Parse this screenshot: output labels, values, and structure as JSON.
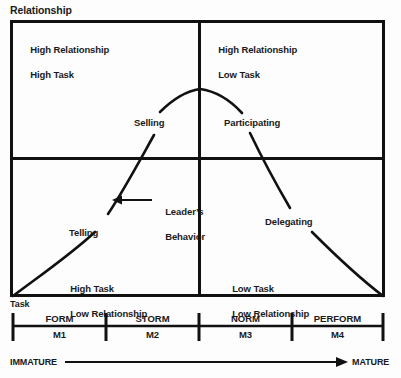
{
  "axes": {
    "y_label": "Relationship",
    "x_label": "Task"
  },
  "quadrants": [
    {
      "id": "q2",
      "line1": "High Relationship",
      "line2": "High Task"
    },
    {
      "id": "q3",
      "line1": "High Relationship",
      "line2": "Low Task"
    },
    {
      "id": "q1",
      "line1": "High Task",
      "line2": "Low Relationship"
    },
    {
      "id": "q4",
      "line1": "Low Task",
      "line2": "Low Relationship"
    }
  ],
  "styles": {
    "selling": "Selling",
    "participating": "Participating",
    "telling": "Telling",
    "delegating": "Delegating"
  },
  "callout": {
    "line1": "Leader’s",
    "line2": "Behavior"
  },
  "maturity_scale": {
    "stages": [
      {
        "name": "FORM",
        "code": "M1"
      },
      {
        "name": "STORM",
        "code": "M2"
      },
      {
        "name": "NORM",
        "code": "M3"
      },
      {
        "name": "PERFORM",
        "code": "M4"
      }
    ],
    "left_end": "IMMATURE",
    "right_end": "MATURE"
  },
  "colors": {
    "ink": "#111111",
    "background": "#fdfdfd"
  }
}
